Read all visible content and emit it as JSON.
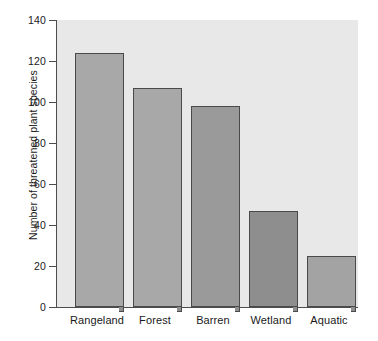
{
  "chart_data": {
    "type": "bar",
    "title": "",
    "subtitle": "",
    "xlabel": "",
    "ylabel": "Number of threatened plant species",
    "categories": [
      "Rangeland",
      "Forest",
      "Barren",
      "Wetland",
      "Aquatic"
    ],
    "values": [
      124,
      107,
      98,
      47,
      25
    ],
    "ylim": [
      0,
      140
    ],
    "yticks": [
      0,
      20,
      40,
      60,
      80,
      100,
      120,
      140
    ],
    "ytick_labels": [
      "0",
      "20",
      "40",
      "60",
      "80",
      "100",
      "120",
      "140"
    ],
    "grid": false,
    "legend": null,
    "annotations": [],
    "bar_colors": [
      "#a8a8a8",
      "#a8a8a8",
      "#9a9a9a",
      "#8e8e8e",
      "#a3a3a3"
    ],
    "plot_background": "#e8e8e8",
    "figure_background": "#ffffff",
    "axis_color": "#4d4d4d",
    "bar_edge_color": "#4a4a4a",
    "bar_shadow_color": "#8f8f8f"
  }
}
